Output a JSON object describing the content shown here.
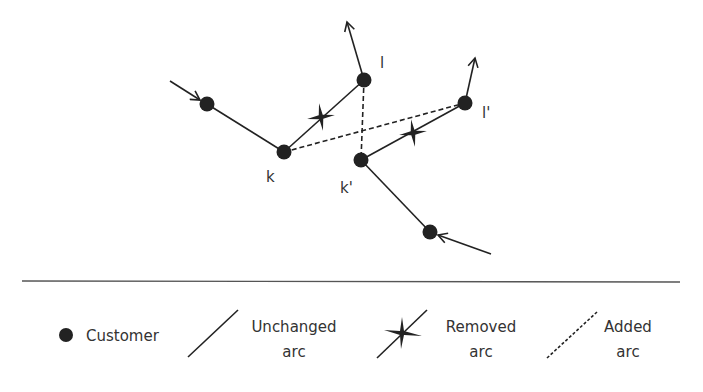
{
  "diagram": {
    "type": "2-opt* exchange between routes",
    "nodes": [
      {
        "id": "n1",
        "x": 207,
        "y": 104,
        "label": ""
      },
      {
        "id": "k",
        "x": 284,
        "y": 152,
        "label": "k"
      },
      {
        "id": "l",
        "x": 364,
        "y": 80,
        "label": "l"
      },
      {
        "id": "kp",
        "x": 361,
        "y": 160,
        "label": "k'"
      },
      {
        "id": "lp",
        "x": 465,
        "y": 103,
        "label": "l'"
      },
      {
        "id": "n6",
        "x": 430,
        "y": 232,
        "label": ""
      }
    ],
    "arcs": [
      {
        "from": "n1",
        "to": "k",
        "kind": "unchanged"
      },
      {
        "from": "k",
        "to": "l",
        "kind": "removed"
      },
      {
        "from": "kp",
        "to": "lp",
        "kind": "removed"
      },
      {
        "from": "kp",
        "to": "n6",
        "kind": "unchanged"
      },
      {
        "from": "k",
        "to": "lp",
        "kind": "added"
      },
      {
        "from": "l",
        "to": "kp",
        "kind": "added"
      }
    ],
    "labels": {
      "k": "k",
      "l": "l",
      "kp": "k'",
      "lp": "l'"
    }
  },
  "legend": {
    "customer": "Customer",
    "unchanged_line1": "Unchanged",
    "unchanged_line2": "arc",
    "removed_line1": "Removed",
    "removed_line2": "arc",
    "added_line1": "Added",
    "added_line2": "arc"
  },
  "colors": {
    "ink": "#222222",
    "text": "#333333",
    "divider": "#555555"
  }
}
